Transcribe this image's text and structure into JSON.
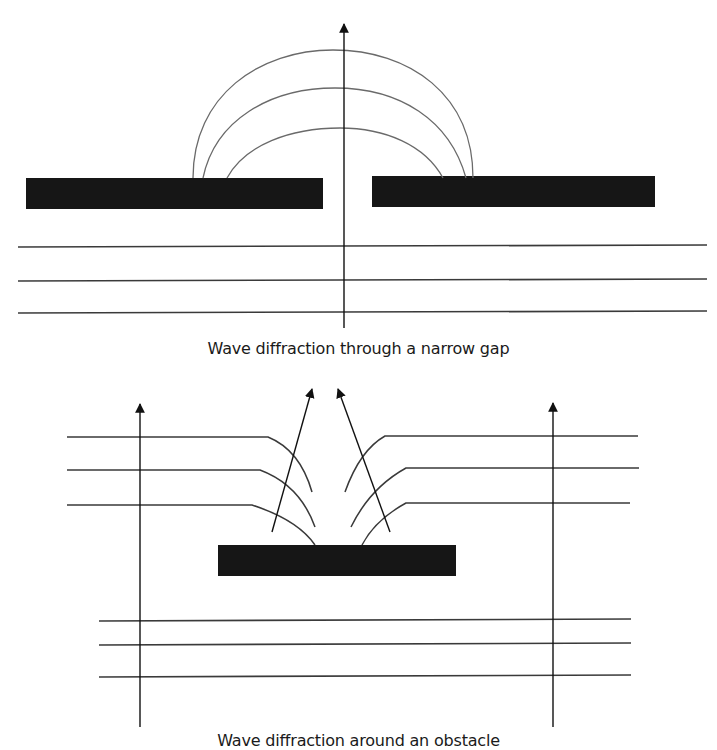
{
  "figures": [
    {
      "id": "narrow-gap",
      "caption": "Wave diffraction through a narrow gap",
      "barriers": [
        {
          "x": 26,
          "y": 178,
          "w": 297,
          "h": 31
        },
        {
          "x": 372,
          "y": 176,
          "w": 283,
          "h": 31
        }
      ],
      "incident_wavefronts_y": [
        247,
        281,
        313
      ],
      "diffracted_arcs": [
        {
          "x1": 193,
          "x2": 473,
          "y": 178,
          "peak": 50
        },
        {
          "x1": 203,
          "x2": 466,
          "y": 178,
          "peak": 88
        },
        {
          "x1": 227,
          "x2": 443,
          "y": 178,
          "peak": 128
        }
      ],
      "direction_arrow": {
        "x": 344,
        "y_start": 328,
        "y_end": 22
      }
    },
    {
      "id": "obstacle",
      "caption": "Wave diffraction around an obstacle",
      "obstacle": {
        "x": 218,
        "y": 545,
        "w": 238,
        "h": 31
      },
      "incident_wavefronts_y": [
        621,
        645,
        677
      ],
      "direction_arrows": [
        {
          "x1": 140,
          "y1": 727,
          "x2": 140,
          "y2": 402
        },
        {
          "x1": 553,
          "y1": 727,
          "x2": 553,
          "y2": 401
        },
        {
          "x1": 272,
          "y1": 532,
          "x2": 312,
          "y2": 387
        },
        {
          "x1": 390,
          "y1": 532,
          "x2": 338,
          "y2": 387
        }
      ]
    }
  ],
  "colors": {
    "barrier": "#161616",
    "line": "#3a3a3a",
    "arc": "#6a6a6a",
    "arrow": "#111111"
  }
}
